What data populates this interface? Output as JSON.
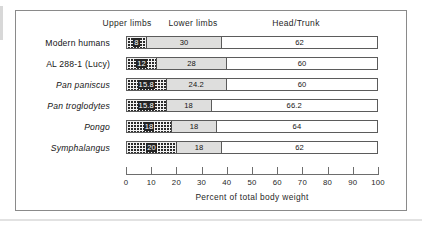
{
  "figure": {
    "column_headers": [
      {
        "label": "Upper limbs",
        "name": "upper-limbs"
      },
      {
        "label": "Lower limbs",
        "name": "lower-limbs"
      },
      {
        "label": "Head/Trunk",
        "name": "head-trunk"
      }
    ],
    "axis_caption": "Percent of total body weight",
    "tick_labels": [
      "0",
      "10",
      "20",
      "30",
      "40",
      "50",
      "60",
      "70",
      "80",
      "90",
      "100"
    ]
  },
  "colors": {
    "frame": "#8a8a8a",
    "bar_outline": "#5b5b5b",
    "upper_limbs_fill": "#2b2b2b",
    "lower_limbs_fill": "#dededd",
    "head_trunk_fill": "#ffffff",
    "text": "#1a1a1a"
  },
  "chart_data": {
    "type": "bar",
    "orientation": "horizontal",
    "stacked": true,
    "title": "",
    "xlabel": "Percent of total body weight",
    "ylabel": "",
    "xlim": [
      0,
      100
    ],
    "xticks": [
      0,
      10,
      20,
      30,
      40,
      50,
      60,
      70,
      80,
      90,
      100
    ],
    "grid": false,
    "legend_position": "top",
    "categories": [
      "Modern humans",
      "AL 288-1 (Lucy)",
      "Pan paniscus",
      "Pan troglodytes",
      "Pongo",
      "Symphalangus"
    ],
    "category_styles": [
      "normal",
      "normal",
      "italic",
      "italic",
      "italic",
      "italic"
    ],
    "series": [
      {
        "name": "Upper limbs",
        "values": [
          8,
          12,
          15.8,
          15.8,
          18,
          20
        ]
      },
      {
        "name": "Lower limbs",
        "values": [
          30,
          28,
          24.2,
          18,
          18,
          18
        ]
      },
      {
        "name": "Head/Trunk",
        "values": [
          62,
          60,
          60,
          66.2,
          64,
          62
        ]
      }
    ],
    "value_labels": [
      {
        "category": "Modern humans",
        "upper": "8",
        "lower": "30",
        "head": "62"
      },
      {
        "category": "AL 288-1 (Lucy)",
        "upper": "12",
        "lower": "28",
        "head": "60"
      },
      {
        "category": "Pan paniscus",
        "upper": "15.8",
        "lower": "24.2",
        "head": "60"
      },
      {
        "category": "Pan troglodytes",
        "upper": "15.8",
        "lower": "18",
        "head": "66.2"
      },
      {
        "category": "Pongo",
        "upper": "18",
        "lower": "18",
        "head": "64"
      },
      {
        "category": "Symphalangus",
        "upper": "20",
        "lower": "18",
        "head": "62"
      }
    ]
  }
}
